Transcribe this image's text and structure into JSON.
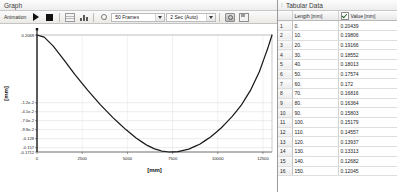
{
  "graph_panel": {
    "title": "Graph",
    "toolbar": {
      "animation_label": "Animation",
      "play_icon": "play-icon",
      "stop_icon": "stop-icon",
      "grid_icon": "grid-icon",
      "bars_icon": "bar-chart-icon",
      "bulb_icon": "light-bulb-icon",
      "frames_value": "50 Frames",
      "duration_value": "2 Sec (Auto)",
      "camera_icon": "camera-icon",
      "export_icon": "export-icon"
    }
  },
  "tabular_panel": {
    "title": "Tabular Data",
    "dots_icon": "grip-dots-icon",
    "columns": [
      "",
      "Length [mm]",
      "Value [mm]"
    ],
    "value_column_checked": true,
    "rows": [
      {
        "idx": "1",
        "length": "0.",
        "value": "0.20439"
      },
      {
        "idx": "2",
        "length": "10.",
        "value": "0.19806"
      },
      {
        "idx": "3",
        "length": "20.",
        "value": "0.19166"
      },
      {
        "idx": "4",
        "length": "30.",
        "value": "0.18552"
      },
      {
        "idx": "5",
        "length": "40.",
        "value": "0.18013"
      },
      {
        "idx": "6",
        "length": "50.",
        "value": "0.17574"
      },
      {
        "idx": "7",
        "length": "60.",
        "value": "0.172"
      },
      {
        "idx": "8",
        "length": "70.",
        "value": "0.16816"
      },
      {
        "idx": "9",
        "length": "80.",
        "value": "0.16364"
      },
      {
        "idx": "10",
        "length": "90.",
        "value": "0.15803"
      },
      {
        "idx": "11",
        "length": "100.",
        "value": "0.15179"
      },
      {
        "idx": "12",
        "length": "110.",
        "value": "0.14557"
      },
      {
        "idx": "13",
        "length": "120.",
        "value": "0.13937"
      },
      {
        "idx": "14",
        "length": "130.",
        "value": "0.13313"
      },
      {
        "idx": "15",
        "length": "140.",
        "value": "0.12682"
      },
      {
        "idx": "16",
        "length": "150.",
        "value": "0.12045"
      }
    ]
  },
  "chart_data": {
    "type": "line",
    "title": "",
    "xlabel": "[mm]",
    "ylabel": "[mm]",
    "xlim": [
      0,
      13000
    ],
    "ylim": [
      -0.1712,
      0.2069
    ],
    "grid": true,
    "legend": null,
    "xticks": [
      "0",
      "2500",
      "5000",
      "7500",
      "10000",
      "12500"
    ],
    "xtick_values": [
      0,
      2500,
      5000,
      7500,
      10000,
      12500
    ],
    "yticks": [
      "0.2069",
      "-1.2e-2",
      "-4.1e-2",
      "-7.0e-2",
      "-9.9e-2",
      "-0.128",
      "-0.157",
      "-0.1712"
    ],
    "ytick_values": [
      0.2069,
      -0.012,
      -0.041,
      -0.07,
      -0.099,
      -0.128,
      -0.157,
      -0.1712
    ],
    "line_color": "#1a1a1a",
    "series": [
      {
        "name": "Deformation",
        "x": [
          0,
          400,
          900,
          1500,
          2100,
          2800,
          3500,
          4200,
          4900,
          5500,
          6100,
          6500,
          6900,
          7300,
          7800,
          8400,
          9000,
          9600,
          10200,
          10800,
          11300,
          11800,
          12300,
          12800,
          13000
        ],
        "y": [
          0.2069,
          0.2,
          0.171,
          0.126,
          0.079,
          0.029,
          -0.018,
          -0.06,
          -0.098,
          -0.127,
          -0.15,
          -0.161,
          -0.168,
          -0.1712,
          -0.17,
          -0.162,
          -0.146,
          -0.123,
          -0.093,
          -0.056,
          -0.02,
          0.027,
          0.088,
          0.17,
          0.2069
        ]
      }
    ]
  }
}
